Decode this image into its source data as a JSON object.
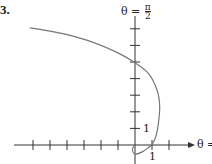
{
  "figure": {
    "number": "3.",
    "top_axis_label": "θ = π/2",
    "top_axis_label_lhs": "θ =",
    "top_axis_label_num": "π",
    "top_axis_label_den": "2",
    "right_axis_label": "θ =",
    "y_tick_label": "1",
    "x_tick_label": "1"
  },
  "chart_data": {
    "type": "line",
    "title": "3.",
    "kind": "polar curve sketch",
    "axes": {
      "horizontal_label": "θ = 0 (polar axis, label cut off as 'θ =')",
      "vertical_label": "θ = π/2",
      "x_ticks": [
        -6,
        -5,
        -4,
        -3,
        -2,
        -1,
        1,
        2
      ],
      "y_ticks": [
        1,
        2,
        3,
        4,
        5,
        6,
        7
      ],
      "labeled_ticks": {
        "x": 1,
        "y": 1
      },
      "xlim": [
        -7.5,
        3.2
      ],
      "ylim": [
        -0.6,
        8.7
      ],
      "grid": false
    },
    "series": [
      {
        "name": "polar curve",
        "color": "#777777",
        "points": [
          [
            0,
            0
          ],
          [
            -0.15,
            -0.25
          ],
          [
            0,
            -0.55
          ],
          [
            0.45,
            -0.4
          ],
          [
            0.85,
            -0.1
          ],
          [
            1.0,
            0.0
          ],
          [
            1.25,
            0.6
          ],
          [
            1.4,
            1.5
          ],
          [
            1.45,
            2.4
          ],
          [
            1.3,
            3.3
          ],
          [
            0.8,
            4.3
          ],
          [
            0.0,
            4.95
          ],
          [
            -1.0,
            5.55
          ],
          [
            -2.5,
            6.2
          ],
          [
            -4.0,
            6.65
          ],
          [
            -5.5,
            6.95
          ],
          [
            -6.2,
            7.05
          ]
        ]
      }
    ]
  }
}
